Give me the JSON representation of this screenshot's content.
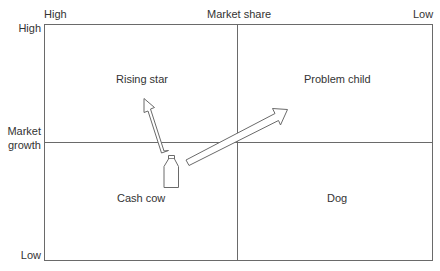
{
  "axes": {
    "top": {
      "label": "Market share",
      "high_label": "High",
      "low_label": "Low"
    },
    "left": {
      "label_line1": "Market",
      "label_line2": "growth",
      "high_label": "High",
      "low_label": "Low"
    }
  },
  "quadrants": [
    {
      "id": "top-left",
      "label": "Rising star"
    },
    {
      "id": "top-right",
      "label": "Problem child"
    },
    {
      "id": "bottom-left",
      "label": "Cash cow"
    },
    {
      "id": "bottom-right",
      "label": "Dog"
    }
  ],
  "icons": {
    "bottle": "milk-bottle-icon",
    "arrow_up": "arrow-to-rising-star",
    "arrow_right": "arrow-to-problem-child"
  },
  "colors": {
    "line": "#555555",
    "text": "#333333",
    "background": "#ffffff"
  }
}
